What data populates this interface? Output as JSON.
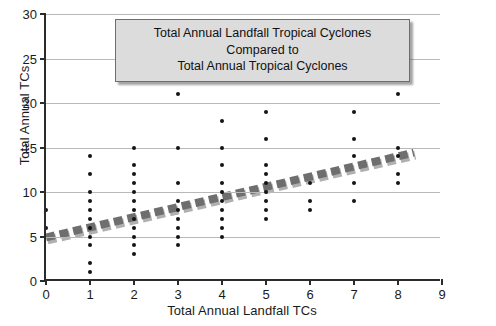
{
  "chart_data": {
    "type": "scatter",
    "title": "Total Annual Landfall Tropical Cyclones Compared to Total Annual Tropical Cyclones",
    "title_lines": [
      "Total Annual Landfall Tropical Cyclones",
      "Compared to",
      "Total Annual Tropical Cyclones"
    ],
    "xlabel": "Total Annual Landfall TCs",
    "ylabel": "Total Annual TCs",
    "xlim": [
      0,
      9
    ],
    "ylim": [
      0,
      30
    ],
    "xticks": [
      0,
      1,
      2,
      3,
      4,
      5,
      6,
      7,
      8,
      9
    ],
    "xtick_labels": [
      "0",
      "1",
      "2",
      "3",
      "4",
      "5",
      "6",
      "7",
      "8",
      "9"
    ],
    "yticks": [
      0,
      5,
      10,
      15,
      20,
      25,
      30
    ],
    "ytick_labels": [
      "0",
      "5",
      "10",
      "15",
      "20",
      "25",
      "30"
    ],
    "grid": "horizontal",
    "legend": "none",
    "marker_color": "#141414",
    "trendline_color": "#6e6e6e",
    "trendline_style": "dashed-thick",
    "trendline": {
      "x0": 0,
      "y0": 4.7,
      "x1": 8.4,
      "y1": 14.3
    },
    "points": [
      {
        "x": 0,
        "y": 8
      },
      {
        "x": 0,
        "y": 6
      },
      {
        "x": 1,
        "y": 14
      },
      {
        "x": 1,
        "y": 12
      },
      {
        "x": 1,
        "y": 10
      },
      {
        "x": 1,
        "y": 9
      },
      {
        "x": 1,
        "y": 8
      },
      {
        "x": 1,
        "y": 7
      },
      {
        "x": 1,
        "y": 6
      },
      {
        "x": 1,
        "y": 5
      },
      {
        "x": 1,
        "y": 4
      },
      {
        "x": 1,
        "y": 2
      },
      {
        "x": 1,
        "y": 1
      },
      {
        "x": 2,
        "y": 15
      },
      {
        "x": 2,
        "y": 13
      },
      {
        "x": 2,
        "y": 12
      },
      {
        "x": 2,
        "y": 11
      },
      {
        "x": 2,
        "y": 10
      },
      {
        "x": 2,
        "y": 9
      },
      {
        "x": 2,
        "y": 8
      },
      {
        "x": 2,
        "y": 7
      },
      {
        "x": 2,
        "y": 6
      },
      {
        "x": 2,
        "y": 5
      },
      {
        "x": 2,
        "y": 4
      },
      {
        "x": 2,
        "y": 3
      },
      {
        "x": 3,
        "y": 21
      },
      {
        "x": 3,
        "y": 15
      },
      {
        "x": 3,
        "y": 11
      },
      {
        "x": 3,
        "y": 9
      },
      {
        "x": 3,
        "y": 8
      },
      {
        "x": 3,
        "y": 7
      },
      {
        "x": 3,
        "y": 6
      },
      {
        "x": 3,
        "y": 5
      },
      {
        "x": 3,
        "y": 4
      },
      {
        "x": 4,
        "y": 18
      },
      {
        "x": 4,
        "y": 15
      },
      {
        "x": 4,
        "y": 13
      },
      {
        "x": 4,
        "y": 11
      },
      {
        "x": 4,
        "y": 10
      },
      {
        "x": 4,
        "y": 9
      },
      {
        "x": 4,
        "y": 8
      },
      {
        "x": 4,
        "y": 7
      },
      {
        "x": 4,
        "y": 6
      },
      {
        "x": 4,
        "y": 5
      },
      {
        "x": 5,
        "y": 19
      },
      {
        "x": 5,
        "y": 16
      },
      {
        "x": 5,
        "y": 13
      },
      {
        "x": 5,
        "y": 12
      },
      {
        "x": 5,
        "y": 11
      },
      {
        "x": 5,
        "y": 10
      },
      {
        "x": 5,
        "y": 9
      },
      {
        "x": 5,
        "y": 8
      },
      {
        "x": 5,
        "y": 7
      },
      {
        "x": 6,
        "y": 11
      },
      {
        "x": 6,
        "y": 9
      },
      {
        "x": 6,
        "y": 8
      },
      {
        "x": 7,
        "y": 19
      },
      {
        "x": 7,
        "y": 16
      },
      {
        "x": 7,
        "y": 14
      },
      {
        "x": 7,
        "y": 11
      },
      {
        "x": 7,
        "y": 9
      },
      {
        "x": 8,
        "y": 28
      },
      {
        "x": 8,
        "y": 21
      },
      {
        "x": 8,
        "y": 15
      },
      {
        "x": 8,
        "y": 14
      },
      {
        "x": 8,
        "y": 12
      },
      {
        "x": 8,
        "y": 11
      }
    ]
  }
}
